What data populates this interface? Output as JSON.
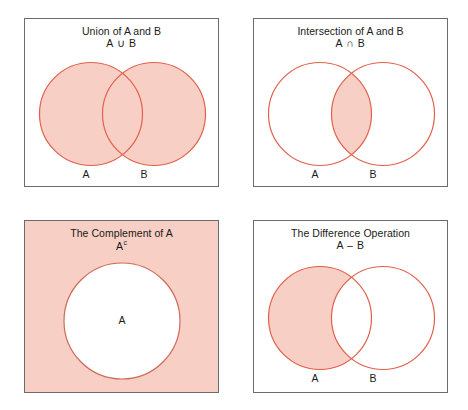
{
  "figure": {
    "width": 468,
    "height": 410,
    "background": "#ffffff",
    "colors": {
      "fill": "#f8cfc4",
      "stroke": "#e0604c",
      "panel_border": "#6b6b6b",
      "text": "#1a1a1a"
    }
  },
  "panels": [
    {
      "id": "union",
      "title": "Union of A and B",
      "notation": "A ∪ B",
      "shaded_region": "both-circles",
      "background_shaded": false,
      "labels": {
        "left": "A",
        "right": "B"
      }
    },
    {
      "id": "intersection",
      "title": "Intersection of A and B",
      "notation": "A ∩ B",
      "shaded_region": "overlap-only",
      "background_shaded": false,
      "labels": {
        "left": "A",
        "right": "B"
      }
    },
    {
      "id": "complement",
      "title": "The Complement of A",
      "notation_base": "A",
      "notation_sup": "c",
      "shaded_region": "outside-circle",
      "background_shaded": true,
      "labels": {
        "center": "A"
      }
    },
    {
      "id": "difference",
      "title": "The Difference Operation",
      "notation": "A – B",
      "shaded_region": "a-minus-b",
      "background_shaded": false,
      "labels": {
        "left": "A",
        "right": "B"
      }
    }
  ]
}
